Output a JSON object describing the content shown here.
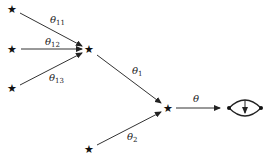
{
  "diagram": {
    "nodes": [
      {
        "id": "leaf1",
        "symbol": "★",
        "x": 12,
        "y": 9
      },
      {
        "id": "leaf2",
        "symbol": "★",
        "x": 12,
        "y": 49
      },
      {
        "id": "leaf3",
        "symbol": "★",
        "x": 12,
        "y": 88
      },
      {
        "id": "mid",
        "symbol": "★",
        "x": 89,
        "y": 49
      },
      {
        "id": "lower",
        "symbol": "★",
        "x": 89,
        "y": 149
      },
      {
        "id": "root",
        "symbol": "★",
        "x": 168,
        "y": 108
      }
    ],
    "edges": [
      {
        "from": "leaf1",
        "to": "mid",
        "label": "θ",
        "sub": "11"
      },
      {
        "from": "leaf2",
        "to": "mid",
        "label": "θ",
        "sub": "12"
      },
      {
        "from": "leaf3",
        "to": "mid",
        "label": "θ",
        "sub": "13"
      },
      {
        "from": "mid",
        "to": "root",
        "label": "θ",
        "sub": "1"
      },
      {
        "from": "lower",
        "to": "root",
        "label": "θ",
        "sub": "2"
      },
      {
        "from": "root",
        "to": "loop-graph",
        "label": "θ",
        "sub": ""
      }
    ],
    "target": {
      "id": "loop-graph",
      "description": "two vertices joined by two arcs with a downward arrow inside"
    }
  }
}
